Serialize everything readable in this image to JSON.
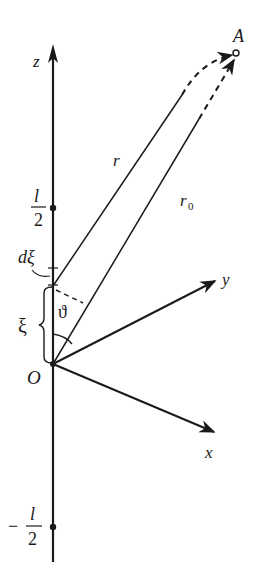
{
  "diagram": {
    "type": "antenna-coordinate-geometry",
    "labels": {
      "z_axis": "z",
      "x_axis": "x",
      "y_axis": "y",
      "origin": "O",
      "point": "A",
      "r": "r",
      "r0_base": "r",
      "r0_sub": "0",
      "half_length_num": "l",
      "half_length_den": "2",
      "neg_sign": "−",
      "element": "dξ",
      "xi": "ξ",
      "angle": "ϑ"
    },
    "colors": {
      "stroke": "#1a1a1a",
      "background": "#ffffff"
    },
    "points": {
      "origin": [
        53,
        364
      ],
      "A": [
        236,
        53
      ],
      "plus_half": [
        53,
        208
      ],
      "minus_half": [
        53,
        527
      ],
      "d_xi": [
        53,
        285
      ]
    }
  }
}
